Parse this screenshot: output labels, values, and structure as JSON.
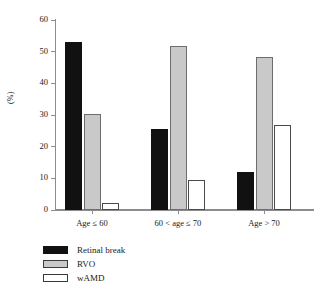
{
  "chart_data": {
    "type": "bar",
    "title": "",
    "xlabel": "",
    "ylabel": "(%)",
    "ylim": [
      0,
      60
    ],
    "yticks": [
      0,
      10,
      20,
      30,
      40,
      50,
      60
    ],
    "grid": false,
    "legend_position": "bottom-left",
    "categories": [
      "Age ≤ 60",
      "60 < age ≤ 70",
      "Age > 70"
    ],
    "series": [
      {
        "name": "Retinal break",
        "color": "#111111",
        "fill": "black",
        "values": [
          53.0,
          25.5,
          12.0
        ]
      },
      {
        "name": "RVO",
        "color": "#c9c9c9",
        "fill": "gray",
        "values": [
          30.4,
          51.7,
          48.2
        ]
      },
      {
        "name": "wAMD",
        "color": "#ffffff",
        "fill": "white",
        "values": [
          2.1,
          9.4,
          26.8
        ]
      }
    ]
  },
  "axis": {
    "y_title": "(%)",
    "y_tick_labels": [
      "0",
      "10",
      "20",
      "30",
      "40",
      "50",
      "60"
    ],
    "x_tick_labels": [
      "Age ≤ 60",
      "60 < age ≤ 70",
      "Age > 70"
    ]
  },
  "legend": {
    "items": [
      {
        "label": "Retinal break",
        "swatch": "black-swatch-icon"
      },
      {
        "label": "RVO",
        "swatch": "gray-swatch-icon"
      },
      {
        "label": "wAMD",
        "swatch": "white-swatch-icon"
      }
    ]
  }
}
